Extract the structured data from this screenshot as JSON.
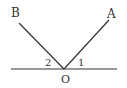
{
  "diagram": {
    "type": "geometry-angles",
    "points": {
      "B": {
        "label": "B"
      },
      "A": {
        "label": "A"
      },
      "O": {
        "label": "O"
      }
    },
    "angles": [
      {
        "label": "2",
        "between": "OB and line"
      },
      {
        "label": "1",
        "between": "OA and line"
      }
    ],
    "colors": {
      "stroke": "#333333",
      "background": "#ffffff"
    }
  }
}
